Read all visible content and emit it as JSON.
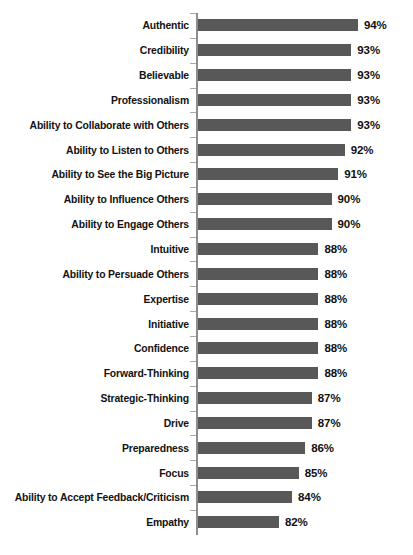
{
  "chart_data": {
    "type": "bar",
    "orientation": "horizontal",
    "title": "",
    "subtitle": "",
    "xlabel": "",
    "ylabel": "",
    "xlim": [
      0,
      100
    ],
    "grid": false,
    "legend": null,
    "value_suffix": "%",
    "bar_color": "#585858",
    "axis_color": "#8d8d8d",
    "categories": [
      "Authentic",
      "Credibility",
      "Believable",
      "Professionalism",
      "Ability to Collaborate with Others",
      "Ability to Listen to Others",
      "Ability to See the Big Picture",
      "Ability to Influence Others",
      "Ability to Engage Others",
      "Intuitive",
      "Ability to Persuade Others",
      "Expertise",
      "Initiative",
      "Confidence",
      "Forward-Thinking",
      "Strategic-Thinking",
      "Drive",
      "Preparedness",
      "Focus",
      "Ability to Accept Feedback/Criticism",
      "Empathy"
    ],
    "values": [
      94,
      93,
      93,
      93,
      93,
      92,
      91,
      90,
      90,
      88,
      88,
      88,
      88,
      88,
      88,
      87,
      87,
      86,
      85,
      84,
      82
    ],
    "data_labels": [
      "94%",
      "93%",
      "93%",
      "93%",
      "93%",
      "92%",
      "91%",
      "90%",
      "90%",
      "88%",
      "88%",
      "88%",
      "88%",
      "88%",
      "88%",
      "87%",
      "87%",
      "86%",
      "85%",
      "84%",
      "82%"
    ]
  }
}
